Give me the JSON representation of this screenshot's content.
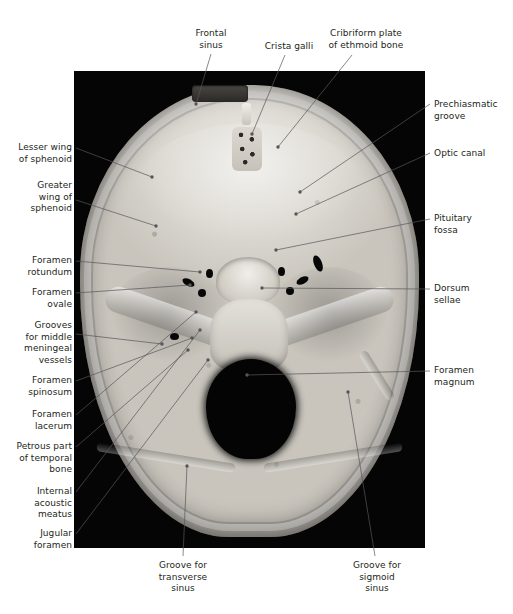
{
  "figure": {
    "type": "anatomical-photograph",
    "panel": {
      "background_color": "#050505",
      "x": 74,
      "y": 71,
      "width": 351,
      "height": 477
    },
    "text_color": "#231f20",
    "leader_color": "#58555a"
  },
  "labels": {
    "top": [
      {
        "id": "frontal-sinus",
        "text": "Frontal\nsinus",
        "x": 178,
        "y": 28,
        "align": "center",
        "width": 66,
        "line": [
          [
            211,
            54
          ],
          [
            196,
            104
          ]
        ]
      },
      {
        "id": "crista-galli",
        "text": "Crista galli",
        "x": 258,
        "y": 41,
        "align": "center",
        "width": 62,
        "line": [
          [
            285,
            55
          ],
          [
            252,
            134
          ]
        ]
      },
      {
        "id": "cribriform-plate",
        "text": "Cribriform plate\nof ethmoid bone",
        "x": 320,
        "y": 28,
        "align": "center",
        "width": 92,
        "line": [
          [
            352,
            55
          ],
          [
            278,
            147
          ]
        ]
      }
    ],
    "left": [
      {
        "id": "lesser-wing-sphenoid",
        "text": "Lesser wing\nof sphenoid",
        "x": 8,
        "y": 142,
        "width": 64,
        "line": [
          [
            76,
            148
          ],
          [
            152,
            177
          ]
        ]
      },
      {
        "id": "greater-wing-sphenoid",
        "text": "Greater\nwing of\nsphenoid",
        "x": 8,
        "y": 180,
        "width": 64,
        "line": [
          [
            76,
            200
          ],
          [
            156,
            226
          ]
        ]
      },
      {
        "id": "foramen-rotundum",
        "text": "Foramen\nrotundum",
        "x": 8,
        "y": 255,
        "width": 64,
        "line": [
          [
            76,
            261
          ],
          [
            200,
            272
          ]
        ]
      },
      {
        "id": "foramen-ovale",
        "text": "Foramen\novale",
        "x": 8,
        "y": 287,
        "width": 64,
        "line": [
          [
            76,
            293
          ],
          [
            190,
            285
          ]
        ]
      },
      {
        "id": "grooves-middle-meningeal",
        "text": "Grooves\nfor middle\nmeningeal\nvessels",
        "x": 8,
        "y": 320,
        "width": 64,
        "line": [
          [
            76,
            334
          ],
          [
            162,
            344
          ]
        ]
      },
      {
        "id": "foramen-spinosum",
        "text": "Foramen\nspinosum",
        "x": 8,
        "y": 375,
        "width": 64,
        "line": [
          [
            76,
            381
          ],
          [
            192,
            338
          ]
        ]
      },
      {
        "id": "foramen-lacerum",
        "text": "Foramen\nlacerum",
        "x": 8,
        "y": 409,
        "width": 64,
        "line": [
          [
            76,
            415
          ],
          [
            196,
            312
          ]
        ]
      },
      {
        "id": "petrous-temporal",
        "text": "Petrous part\nof temporal\nbone",
        "x": 8,
        "y": 441,
        "width": 64,
        "line": [
          [
            76,
            447
          ],
          [
            188,
            350
          ]
        ]
      },
      {
        "id": "internal-acoustic-meatus",
        "text": "Internal\nacoustic\nmeatus",
        "x": 8,
        "y": 486,
        "width": 64,
        "line": [
          [
            76,
            492
          ],
          [
            200,
            330
          ]
        ]
      },
      {
        "id": "jugular-foramen",
        "text": "Jugular\nforamen",
        "x": 8,
        "y": 528,
        "width": 64,
        "line": [
          [
            76,
            534
          ],
          [
            208,
            360
          ]
        ]
      }
    ],
    "right": [
      {
        "id": "prechiasmatic-groove",
        "text": "Prechiasmatic\ngroove",
        "x": 434,
        "y": 99,
        "width": 76,
        "line": [
          [
            430,
            104
          ],
          [
            300,
            192
          ]
        ]
      },
      {
        "id": "optic-canal",
        "text": "Optic canal",
        "x": 434,
        "y": 148,
        "width": 76,
        "line": [
          [
            430,
            153
          ],
          [
            296,
            214
          ]
        ]
      },
      {
        "id": "pituitary-fossa",
        "text": "Pituitary\nfossa",
        "x": 434,
        "y": 213,
        "width": 76,
        "line": [
          [
            430,
            219
          ],
          [
            276,
            250
          ]
        ]
      },
      {
        "id": "dorsum-sellae",
        "text": "Dorsum\nsellae",
        "x": 434,
        "y": 283,
        "width": 76,
        "line": [
          [
            430,
            289
          ],
          [
            262,
            288
          ]
        ]
      },
      {
        "id": "foramen-magnum",
        "text": "Foramen\nmagnum",
        "x": 434,
        "y": 365,
        "width": 76,
        "line": [
          [
            430,
            371
          ],
          [
            247,
            375
          ]
        ]
      }
    ],
    "bottom": [
      {
        "id": "groove-transverse-sinus",
        "text": "Groove for\ntransverse\nsinus",
        "x": 146,
        "y": 560,
        "align": "center",
        "width": 74,
        "line": [
          [
            183,
            556
          ],
          [
            187,
            466
          ]
        ]
      },
      {
        "id": "groove-sigmoid-sinus",
        "text": "Groove for\nsigmoid\nsinus",
        "x": 340,
        "y": 560,
        "align": "center",
        "width": 74,
        "line": [
          [
            375,
            556
          ],
          [
            348,
            392
          ]
        ]
      }
    ]
  }
}
